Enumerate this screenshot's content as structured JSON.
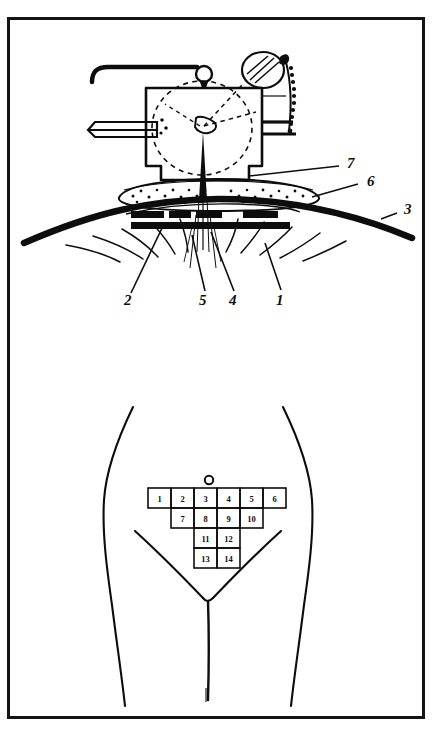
{
  "figure": {
    "domain_kind": "anatomical-technical-illustration",
    "border_color": "#141414",
    "ink_color": "#0d0d0d",
    "background_color": "#ffffff",
    "panels": [
      {
        "name": "upper-panel",
        "description": "Cross-sectional diagram of a device applied to the abdominal wall"
      },
      {
        "name": "lower-panel",
        "description": "Frontal outline of lower abdomen with numbered injection-site grid"
      }
    ]
  },
  "upper_panel": {
    "name": "device-cross-section",
    "callouts": [
      {
        "id": "callout-7",
        "label": "7",
        "x": 347,
        "y": 168,
        "side": "right"
      },
      {
        "id": "callout-6",
        "label": "6",
        "x": 367,
        "y": 186,
        "side": "right"
      },
      {
        "id": "callout-3",
        "label": "3",
        "x": 404,
        "y": 214,
        "side": "right"
      },
      {
        "id": "callout-2",
        "label": "2",
        "x": 128,
        "y": 305,
        "side": "bottom"
      },
      {
        "id": "callout-5",
        "label": "5",
        "x": 203,
        "y": 305,
        "side": "bottom"
      },
      {
        "id": "callout-4",
        "label": "4",
        "x": 233,
        "y": 305,
        "side": "bottom"
      },
      {
        "id": "callout-1",
        "label": "1",
        "x": 279,
        "y": 305,
        "side": "bottom"
      }
    ],
    "parts": {
      "housing": "device-housing",
      "handle_rod": "hooked-handle-rod",
      "side_tube": "horizontal-shaft-tube",
      "knob": "hatched-spherical-knob",
      "serrated_strip": "serrated-rack-strip",
      "internal_wheel": "dashed-internal-wheel",
      "needle": "needle-spike",
      "pad": "stippled-cushion-pad",
      "base_plate": "base-plate",
      "abdominal_wall": "abdominal-wall-arc",
      "tissue_hatching": "radiating-tissue-lines"
    }
  },
  "lower_panel": {
    "name": "abdomen-site-map",
    "umbilicus": {
      "name": "umbilicus-marker",
      "cx": 209,
      "cy": 480,
      "r": 4.2
    },
    "grid": {
      "name": "injection-site-grid",
      "cell_width": 23,
      "cell_height": 20,
      "rows": [
        {
          "row_index": 0,
          "x_start": 148,
          "y": 488,
          "cells": [
            {
              "label": "1"
            },
            {
              "label": "2"
            },
            {
              "label": "3"
            },
            {
              "label": "4"
            },
            {
              "label": "5"
            },
            {
              "label": "6"
            }
          ]
        },
        {
          "row_index": 1,
          "x_start": 171,
          "y": 508,
          "cells": [
            {
              "label": "7"
            },
            {
              "label": "8"
            },
            {
              "label": "9"
            },
            {
              "label": "10"
            }
          ]
        },
        {
          "row_index": 2,
          "x_start": 194,
          "y": 528,
          "cells": [
            {
              "label": "11"
            },
            {
              "label": "12"
            }
          ]
        },
        {
          "row_index": 3,
          "x_start": 194,
          "y": 548,
          "cells": [
            {
              "label": "13"
            },
            {
              "label": "14"
            }
          ]
        }
      ]
    },
    "body_outline": {
      "name": "torso-outline",
      "features": [
        "left-flank-curve",
        "right-flank-curve",
        "inguinal-fold-left",
        "inguinal-fold-right",
        "midline-cleft"
      ]
    }
  }
}
